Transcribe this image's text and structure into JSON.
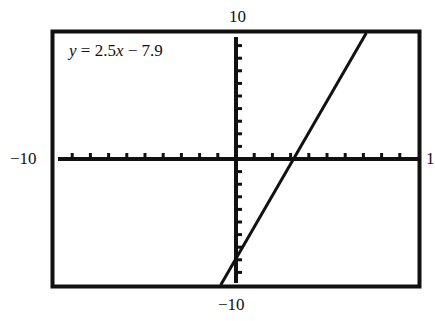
{
  "chart_data": {
    "type": "line",
    "title": "",
    "equation": "y = 2.5x − 7.9",
    "slope": 2.5,
    "intercept": -7.9,
    "xlim": [
      -10,
      10
    ],
    "ylim": [
      -10,
      10
    ],
    "x_tick_step": 1,
    "y_tick_step": 1,
    "grid": false,
    "axis_labels": {
      "top": "10",
      "bottom": "−10",
      "left": "−10",
      "right": "1"
    },
    "series": [
      {
        "name": "y = 2.5x − 7.9",
        "x": [
          -0.84,
          7.16
        ],
        "y": [
          -10,
          10
        ]
      }
    ],
    "x_intercept": 3.16,
    "y_intercept": -7.9,
    "colors": {
      "line": "#111111",
      "frame": "#111111",
      "background": "#ffffff"
    }
  },
  "equation": {
    "y_var": "y",
    "equals": " = 2.5",
    "x_var": "x",
    "rest": " − 7.9"
  },
  "labels": {
    "top": "10",
    "bottom": "−10",
    "left": "−10",
    "right": "1"
  }
}
